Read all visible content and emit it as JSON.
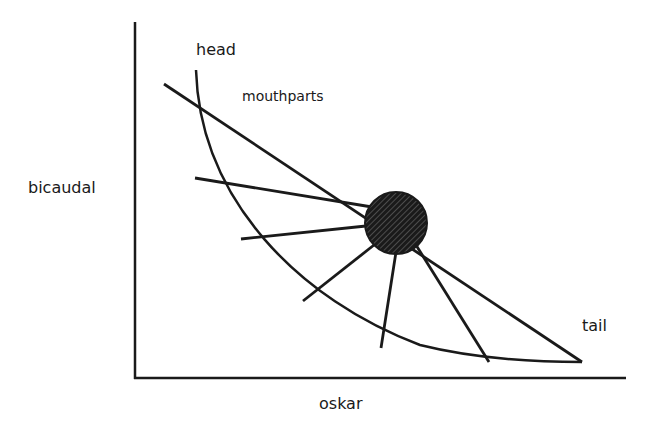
{
  "diagram": {
    "axes": {
      "x_label": "oskar",
      "y_label": "bicaudal"
    },
    "annotations": {
      "head": "head",
      "mouthparts": "mouthparts",
      "tail": "tail"
    },
    "center_node": {
      "shape": "circle",
      "fill": "hatched-dark",
      "color": "#1a1a1a"
    },
    "elements": [
      "curved arc from head to tail",
      "straight line from upper-left through center node to tail",
      "five spoke lines radiating from center node to the arc"
    ],
    "line_color": "#1a1a1a",
    "background": "#ffffff"
  }
}
